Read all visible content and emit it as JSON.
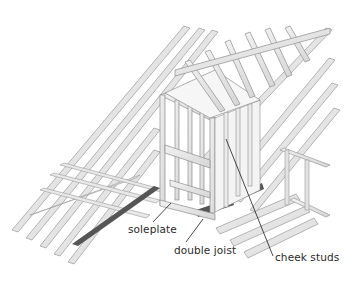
{
  "diagram": {
    "labels": [
      {
        "id": "soleplate",
        "text": "soleplate",
        "x": 128,
        "y": 224,
        "leader": [
          [
            171,
            203
          ],
          [
            153,
            222
          ]
        ]
      },
      {
        "id": "double-joist",
        "text": "double joist",
        "x": 174,
        "y": 245,
        "leader": [
          [
            203,
            219
          ],
          [
            186,
            242
          ]
        ]
      },
      {
        "id": "cheek-studs",
        "text": "cheek studs",
        "x": 275,
        "y": 252,
        "leader": [
          [
            226,
            139
          ],
          [
            273,
            256
          ]
        ]
      }
    ],
    "colors": {
      "timber": "#e6e6e6",
      "timber_edge": "#9a9a9a",
      "shadow": "#555555",
      "leader": "#1a1a1a",
      "text": "#2a2a2a"
    }
  }
}
